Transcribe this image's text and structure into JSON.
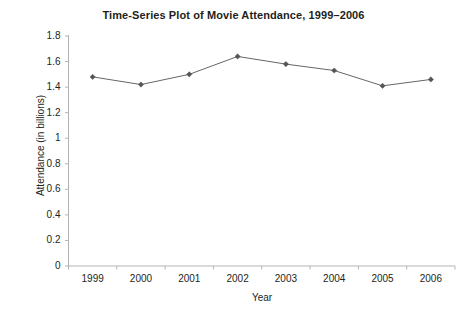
{
  "chart_data": {
    "type": "line",
    "title": "Time-Series Plot of Movie Attendance, 1999–2006",
    "xlabel": "Year",
    "ylabel": "Attendance (in billions)",
    "categories": [
      "1999",
      "2000",
      "2001",
      "2002",
      "2003",
      "2004",
      "2005",
      "2006"
    ],
    "values": [
      1.48,
      1.42,
      1.5,
      1.64,
      1.58,
      1.53,
      1.41,
      1.46
    ],
    "series": [
      {
        "name": "Attendance",
        "values": [
          1.48,
          1.42,
          1.5,
          1.64,
          1.58,
          1.53,
          1.41,
          1.46
        ]
      }
    ],
    "ylim": [
      0,
      1.8
    ],
    "y_ticks": [
      0,
      0.2,
      0.4,
      0.6,
      0.8,
      1,
      1.2,
      1.4,
      1.6,
      1.8
    ],
    "y_tick_labels": [
      "0",
      "0.2",
      "0.4",
      "0.6",
      "0.8",
      "1",
      "1.2",
      "1.4",
      "1.6",
      "1.8"
    ],
    "x_tick_labels": [
      "1999",
      "2000",
      "2001",
      "2002",
      "2003",
      "2004",
      "2005",
      "2006"
    ],
    "grid": false,
    "legend": false,
    "legend_position": "none",
    "marker": "diamond",
    "line_color": "#666666",
    "marker_color": "#555555",
    "axis_color": "#b3b3b3",
    "background_color": "#ffffff",
    "text_color": "#231f20"
  }
}
